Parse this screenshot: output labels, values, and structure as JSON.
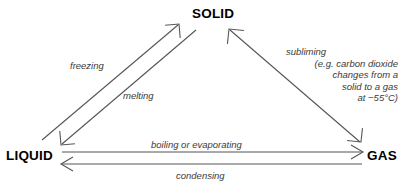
{
  "diagram": {
    "type": "phase-change-triangle",
    "states": {
      "solid": "SOLID",
      "liquid": "LIQUID",
      "gas": "GAS"
    },
    "transitions": {
      "freezing": "freezing",
      "melting": "melting",
      "boiling": "boiling or evaporating",
      "condensing": "condensing",
      "subliming": "subliming"
    },
    "sublimation_note": {
      "line1": "(e.g. carbon dioxide",
      "line2": "changes from a",
      "line3": "solid to a gas",
      "line4": "at −55°C)"
    },
    "colors": {
      "text": "#000000",
      "label_text": "#3a3a3a",
      "line": "#555555",
      "background": "#ffffff"
    }
  }
}
